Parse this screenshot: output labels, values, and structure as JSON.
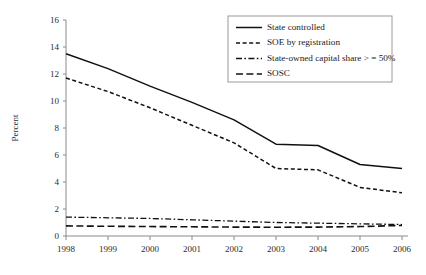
{
  "chart_data": {
    "type": "line",
    "title": "",
    "xlabel": "",
    "ylabel": "Percent",
    "x": [
      1998,
      1999,
      2000,
      2001,
      2002,
      2003,
      2004,
      2005,
      2006
    ],
    "xtick_labels": [
      "1998",
      "1999",
      "2000",
      "2001",
      "2002",
      "2003",
      "2004",
      "2005",
      "2006"
    ],
    "ytick_labels": [
      "0",
      "2",
      "4",
      "6",
      "8",
      "10",
      "12",
      "14",
      "16"
    ],
    "ytick_values": [
      0,
      2,
      4,
      6,
      8,
      10,
      12,
      14,
      16
    ],
    "ylim": [
      0,
      16
    ],
    "xlim": [
      1998,
      2006
    ],
    "grid": false,
    "legend_position": "top-right",
    "series": [
      {
        "name": "State controlled",
        "style": "solid",
        "color": "#111111",
        "values": [
          13.5,
          12.4,
          11.1,
          9.9,
          8.6,
          6.8,
          6.7,
          5.3,
          5.0
        ]
      },
      {
        "name": "SOE by registration",
        "style": "dashed",
        "color": "#111111",
        "values": [
          11.7,
          10.7,
          9.5,
          8.2,
          6.9,
          5.0,
          4.9,
          3.6,
          3.2
        ]
      },
      {
        "name": "State-owned capital share > = 50%",
        "style": "dash-dot",
        "color": "#111111",
        "values": [
          1.4,
          1.35,
          1.3,
          1.2,
          1.1,
          1.0,
          0.95,
          0.9,
          0.85
        ]
      },
      {
        "name": "SOSC",
        "style": "long-dash",
        "color": "#111111",
        "values": [
          0.75,
          0.72,
          0.7,
          0.68,
          0.66,
          0.65,
          0.66,
          0.7,
          0.78
        ]
      }
    ]
  },
  "legend": {
    "entries": [
      {
        "label": "State controlled"
      },
      {
        "label": "SOE by registration"
      },
      {
        "label": "State-owned capital share > = 50%"
      },
      {
        "label": "SOSC"
      }
    ]
  },
  "axis": {
    "y_title": "Percent"
  }
}
